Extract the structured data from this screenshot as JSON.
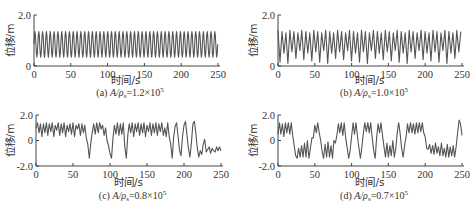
{
  "chart_data": [
    {
      "id": "a",
      "type": "line",
      "caption_prefix": "(a) ",
      "caption_var": "A/ρ",
      "caption_sub": "s",
      "caption_value": "=1.2×10",
      "caption_exp": "5",
      "xlabel": "时间/s",
      "ylabel": "位移/m",
      "xlim": [
        0,
        250
      ],
      "ylim": [
        0,
        2.0
      ],
      "xticks": [
        "0",
        "50",
        "100",
        "150",
        "200",
        "250"
      ],
      "yticks": [
        "0",
        "2.0"
      ],
      "series": [
        {
          "name": "displacement",
          "description": "regular oscillation, ~48 cycles over 250 s, range ~0.35 to ~1.35 m",
          "period_s": 5.2,
          "min": 0.35,
          "max": 1.35
        }
      ]
    },
    {
      "id": "b",
      "type": "line",
      "caption_prefix": "(b) ",
      "caption_var": "A/ρ",
      "caption_sub": "s",
      "caption_value": "=1.0×10",
      "caption_exp": "5",
      "xlabel": "时间/s",
      "ylabel": "位移/m",
      "xlim": [
        0,
        250
      ],
      "ylim": [
        0,
        2.0
      ],
      "xticks": [
        "0",
        "50",
        "100",
        "150",
        "200",
        "250"
      ],
      "yticks": [
        "0",
        "2.0"
      ],
      "series": [
        {
          "name": "displacement",
          "description": "period-doubled oscillation with alternating minima ~0.1 and ~0.5 m, maxima ~1.35 m",
          "period_s": 5.4,
          "min": 0.1,
          "max": 1.4
        }
      ]
    },
    {
      "id": "c",
      "type": "line",
      "caption_prefix": "(c) ",
      "caption_var": "A/ρ",
      "caption_sub": "s",
      "caption_value": "=0.8×10",
      "caption_exp": "5",
      "xlabel": "时间/s",
      "ylabel": "位移/m",
      "xlim": [
        0,
        250
      ],
      "ylim": [
        -2.0,
        2.0
      ],
      "xticks": [
        "0",
        "50",
        "100",
        "150",
        "200",
        "250"
      ],
      "yticks": [
        "-2.0",
        "0",
        "2.0"
      ],
      "series": [
        {
          "name": "displacement",
          "description": "chaotic: mostly oscillating 0.2–1.4 m with intermittent deep dips to ~-1.4 m",
          "points": [
            [
              0,
              1.0
            ],
            [
              2,
              1.4
            ],
            [
              4,
              0.6
            ],
            [
              6,
              1.3
            ],
            [
              8,
              0.3
            ],
            [
              10,
              1.3
            ],
            [
              12,
              0.6
            ],
            [
              14,
              1.4
            ],
            [
              16,
              0.4
            ],
            [
              18,
              1.3
            ],
            [
              20,
              0.7
            ],
            [
              22,
              1.4
            ],
            [
              24,
              0.3
            ],
            [
              26,
              1.2
            ],
            [
              28,
              0.8
            ],
            [
              30,
              1.4
            ],
            [
              32,
              0.4
            ],
            [
              34,
              1.3
            ],
            [
              36,
              0.6
            ],
            [
              38,
              1.4
            ],
            [
              40,
              0.3
            ],
            [
              42,
              1.2
            ],
            [
              44,
              0.7
            ],
            [
              46,
              1.3
            ],
            [
              48,
              0.5
            ],
            [
              50,
              1.4
            ],
            [
              52,
              0.3
            ],
            [
              54,
              1.2
            ],
            [
              56,
              0.9
            ],
            [
              58,
              1.3
            ],
            [
              60,
              0.4
            ],
            [
              62,
              1.3
            ],
            [
              64,
              0.6
            ],
            [
              66,
              1.2
            ],
            [
              68,
              0.2
            ],
            [
              70,
              -0.3
            ],
            [
              72,
              -1.4
            ],
            [
              74,
              -0.2
            ],
            [
              76,
              0.6
            ],
            [
              78,
              1.3
            ],
            [
              80,
              0.5
            ],
            [
              82,
              1.4
            ],
            [
              84,
              0.6
            ],
            [
              86,
              1.4
            ],
            [
              88,
              0.9
            ],
            [
              90,
              1.2
            ],
            [
              92,
              0.4
            ],
            [
              94,
              1.0
            ],
            [
              96,
              0.0
            ],
            [
              98,
              -0.4
            ],
            [
              100,
              -1.0
            ],
            [
              102,
              -1.4
            ],
            [
              104,
              0.2
            ],
            [
              106,
              1.2
            ],
            [
              108,
              0.5
            ],
            [
              110,
              1.4
            ],
            [
              112,
              0.4
            ],
            [
              114,
              1.3
            ],
            [
              116,
              0.5
            ],
            [
              118,
              1.4
            ],
            [
              120,
              -0.5
            ],
            [
              122,
              -1.4
            ],
            [
              124,
              0.4
            ],
            [
              126,
              1.3
            ],
            [
              128,
              0.6
            ],
            [
              130,
              1.4
            ],
            [
              132,
              0.3
            ],
            [
              134,
              1.3
            ],
            [
              136,
              0.7
            ],
            [
              138,
              1.4
            ],
            [
              140,
              0.4
            ],
            [
              142,
              1.3
            ],
            [
              144,
              0.6
            ],
            [
              146,
              1.4
            ],
            [
              148,
              0.3
            ],
            [
              150,
              1.2
            ],
            [
              152,
              0.7
            ],
            [
              154,
              1.4
            ],
            [
              156,
              0.4
            ],
            [
              158,
              1.3
            ],
            [
              160,
              0.6
            ],
            [
              162,
              1.4
            ],
            [
              164,
              0.4
            ],
            [
              166,
              1.3
            ],
            [
              168,
              0.7
            ],
            [
              170,
              1.4
            ],
            [
              172,
              0.4
            ],
            [
              174,
              1.0
            ],
            [
              176,
              0.3
            ],
            [
              178,
              1.4
            ],
            [
              180,
              0.3
            ],
            [
              182,
              -0.3
            ],
            [
              184,
              -1.4
            ],
            [
              186,
              0.2
            ],
            [
              188,
              1.1
            ],
            [
              190,
              1.4
            ],
            [
              192,
              0.3
            ],
            [
              194,
              -0.8
            ],
            [
              196,
              -1.2
            ],
            [
              198,
              0.3
            ],
            [
              200,
              1.2
            ],
            [
              202,
              1.5
            ],
            [
              204,
              0.4
            ],
            [
              206,
              -0.6
            ],
            [
              208,
              -1.3
            ],
            [
              210,
              -0.2
            ],
            [
              212,
              1.3
            ],
            [
              214,
              1.5
            ],
            [
              216,
              0.6
            ],
            [
              218,
              -0.6
            ],
            [
              220,
              -1.3
            ],
            [
              222,
              -0.8
            ],
            [
              224,
              -1.1
            ],
            [
              226,
              -0.3
            ],
            [
              228,
              0.1
            ],
            [
              230,
              -0.9
            ],
            [
              232,
              -0.7
            ],
            [
              234,
              -0.5
            ],
            [
              236,
              -1.0
            ],
            [
              238,
              -0.6
            ],
            [
              240,
              -0.8
            ],
            [
              242,
              -0.9
            ],
            [
              244,
              -0.5
            ],
            [
              246,
              -0.8
            ],
            [
              248,
              -0.5
            ],
            [
              250,
              -0.8
            ]
          ]
        }
      ]
    },
    {
      "id": "d",
      "type": "line",
      "caption_prefix": "(d) ",
      "caption_var": "A/ρ",
      "caption_sub": "s",
      "caption_value": "=0.7×10",
      "caption_exp": "5",
      "xlabel": "时间/s",
      "ylabel": "位移/m",
      "xlim": [
        0,
        250
      ],
      "ylim": [
        -2.0,
        2.0
      ],
      "xticks": [
        "0",
        "50",
        "100",
        "150",
        "200",
        "250"
      ],
      "yticks": [
        "-2.0",
        "0",
        "2.0"
      ],
      "series": [
        {
          "name": "displacement",
          "description": "chaotic switching between upper well (~0.2–1.4 m) and lower well (~-1.4 to 0 m)",
          "points": [
            [
              0,
              0.5
            ],
            [
              2,
              1.4
            ],
            [
              4,
              0.5
            ],
            [
              6,
              1.3
            ],
            [
              8,
              0.3
            ],
            [
              10,
              1.4
            ],
            [
              12,
              0.6
            ],
            [
              14,
              1.4
            ],
            [
              16,
              0.5
            ],
            [
              18,
              1.4
            ],
            [
              20,
              0.4
            ],
            [
              22,
              -0.4
            ],
            [
              24,
              -1.2
            ],
            [
              26,
              -1.4
            ],
            [
              28,
              -0.6
            ],
            [
              30,
              -1.3
            ],
            [
              32,
              -0.4
            ],
            [
              34,
              -1.3
            ],
            [
              36,
              -0.2
            ],
            [
              38,
              -1.3
            ],
            [
              40,
              0.0
            ],
            [
              42,
              -1.4
            ],
            [
              44,
              -0.6
            ],
            [
              46,
              0.2
            ],
            [
              48,
              0.2
            ],
            [
              50,
              1.2
            ],
            [
              52,
              0.6
            ],
            [
              54,
              1.4
            ],
            [
              56,
              0.6
            ],
            [
              58,
              0.0
            ],
            [
              60,
              -0.9
            ],
            [
              62,
              -1.4
            ],
            [
              64,
              -0.3
            ],
            [
              66,
              -1.3
            ],
            [
              68,
              -0.1
            ],
            [
              70,
              -1.3
            ],
            [
              72,
              -0.4
            ],
            [
              74,
              -1.4
            ],
            [
              76,
              0.0
            ],
            [
              78,
              -0.2
            ],
            [
              80,
              0.4
            ],
            [
              82,
              1.3
            ],
            [
              84,
              0.6
            ],
            [
              86,
              1.4
            ],
            [
              88,
              0.4
            ],
            [
              90,
              1.4
            ],
            [
              92,
              0.2
            ],
            [
              94,
              -0.6
            ],
            [
              96,
              -1.4
            ],
            [
              98,
              -0.8
            ],
            [
              100,
              0.3
            ],
            [
              102,
              1.4
            ],
            [
              104,
              0.5
            ],
            [
              106,
              1.4
            ],
            [
              108,
              0.3
            ],
            [
              110,
              -0.6
            ],
            [
              112,
              -1.4
            ],
            [
              114,
              -0.5
            ],
            [
              116,
              0.6
            ],
            [
              118,
              1.4
            ],
            [
              120,
              0.7
            ],
            [
              122,
              1.4
            ],
            [
              124,
              0.6
            ],
            [
              126,
              1.4
            ],
            [
              128,
              0.2
            ],
            [
              130,
              -0.8
            ],
            [
              132,
              -1.4
            ],
            [
              134,
              0.2
            ],
            [
              136,
              1.3
            ],
            [
              138,
              0.6
            ],
            [
              140,
              1.4
            ],
            [
              142,
              0.4
            ],
            [
              144,
              -0.5
            ],
            [
              146,
              -1.3
            ],
            [
              148,
              -0.2
            ],
            [
              150,
              -1.3
            ],
            [
              152,
              -0.4
            ],
            [
              154,
              -1.2
            ],
            [
              156,
              0.0
            ],
            [
              158,
              -1.3
            ],
            [
              160,
              -0.6
            ],
            [
              162,
              0.6
            ],
            [
              164,
              1.4
            ],
            [
              166,
              0.5
            ],
            [
              168,
              -0.6
            ],
            [
              170,
              -1.3
            ],
            [
              172,
              -0.4
            ],
            [
              174,
              0.3
            ],
            [
              176,
              1.3
            ],
            [
              178,
              0.6
            ],
            [
              180,
              1.4
            ],
            [
              182,
              0.6
            ],
            [
              184,
              1.3
            ],
            [
              186,
              0.5
            ],
            [
              188,
              1.4
            ],
            [
              190,
              0.6
            ],
            [
              192,
              1.4
            ],
            [
              194,
              0.7
            ],
            [
              196,
              1.4
            ],
            [
              198,
              0.6
            ],
            [
              200,
              0.3
            ],
            [
              202,
              -0.6
            ],
            [
              204,
              -0.7
            ],
            [
              206,
              -0.3
            ],
            [
              208,
              -1.0
            ],
            [
              210,
              -0.4
            ],
            [
              212,
              -1.1
            ],
            [
              214,
              -0.2
            ],
            [
              216,
              -1.0
            ],
            [
              218,
              -0.5
            ],
            [
              220,
              -1.2
            ],
            [
              222,
              -0.2
            ],
            [
              224,
              -1.2
            ],
            [
              226,
              -0.6
            ],
            [
              228,
              -1.3
            ],
            [
              230,
              -0.3
            ],
            [
              232,
              -1.3
            ],
            [
              234,
              -0.5
            ],
            [
              236,
              -1.2
            ],
            [
              238,
              -0.4
            ],
            [
              240,
              -1.3
            ],
            [
              242,
              -0.5
            ],
            [
              244,
              0.6
            ],
            [
              246,
              1.6
            ],
            [
              248,
              1.3
            ],
            [
              250,
              0.4
            ]
          ]
        }
      ]
    }
  ]
}
